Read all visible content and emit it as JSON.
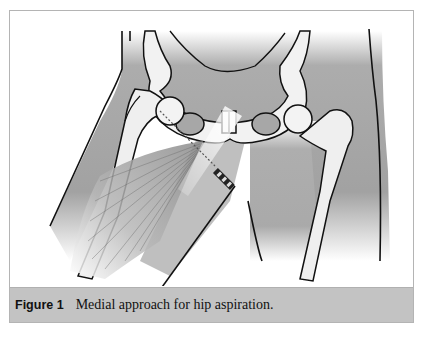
{
  "figure": {
    "label": "Figure 1",
    "caption": "Medial approach for hip aspiration.",
    "illustration": {
      "subject": "anterior view of pelvis and hip joints with thighs",
      "elements": [
        "pelvis",
        "left-femur",
        "right-femur",
        "pubic-symphysis",
        "obturator-foramen",
        "adductor-muscle",
        "aspiration-needle-syringe"
      ]
    }
  },
  "colors": {
    "caption_band": "#c3c3c3",
    "frame_border": "#b4b4b4",
    "skin_shade": "#9a9a9a",
    "bone": "#f2f2f2",
    "outline": "#111111"
  }
}
